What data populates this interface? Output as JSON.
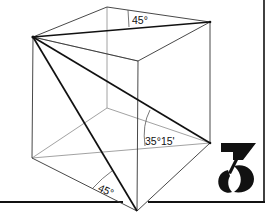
{
  "diagram": {
    "type": "cube-angle-illustration",
    "colors": {
      "background": "#ffffff",
      "ink": "#111111",
      "thin_line": "#6a6a6a",
      "hidden_line": "#9a9a9a"
    },
    "vertices": {
      "left_top": [
        33,
        37
      ],
      "back_top": [
        107,
        7
      ],
      "right_top": [
        210,
        22
      ],
      "front_top": [
        138,
        61
      ],
      "back_bottom": [
        107,
        108
      ],
      "left_bottom": [
        32,
        158
      ],
      "right_bottom": [
        210,
        143
      ],
      "front_bottom": [
        137,
        211
      ]
    },
    "angle_labels": [
      {
        "id": "top-face-angle",
        "text": "45°"
      },
      {
        "id": "space-diagonal-angle",
        "text": "35°15'"
      },
      {
        "id": "side-face-angle",
        "text": "45°"
      }
    ]
  },
  "logo": {
    "text": "3",
    "description": "stylized numeral three logo"
  }
}
